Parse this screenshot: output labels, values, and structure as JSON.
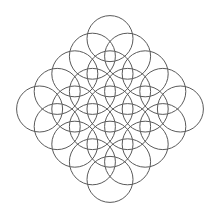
{
  "diagram": {
    "title": "",
    "background": "#ffffff",
    "stroke_color": "#5a5a5a",
    "stroke_width": 1,
    "center": [
      110,
      109
    ],
    "step": 17.6,
    "radius": 23,
    "grid_size": 5,
    "row_counts": [
      1,
      2,
      3,
      4,
      5,
      4,
      3,
      2,
      1
    ],
    "circle_count": 25
  }
}
